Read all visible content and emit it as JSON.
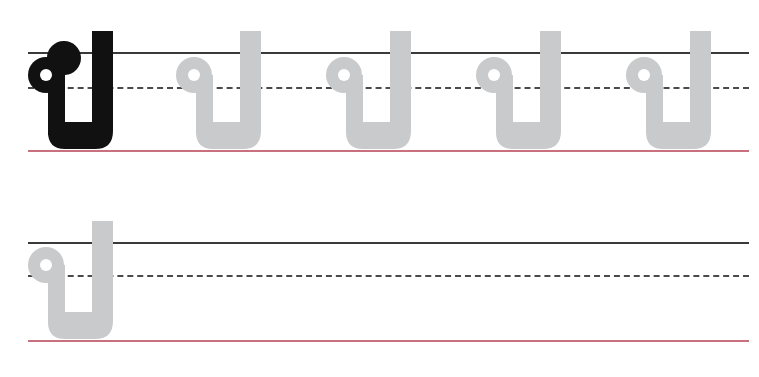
{
  "worksheet": {
    "character": "ป",
    "character_name": "Thai letter po pla",
    "colors": {
      "model_glyph": "#111111",
      "trace_glyph": "#c8cacb",
      "top_line": "#3a3a3a",
      "mid_line": "#4a4a4a",
      "base_line": "#c8707e"
    },
    "rows": [
      {
        "glyphs": [
          {
            "char": "ป",
            "style": "model"
          },
          {
            "char": "ป",
            "style": "trace"
          },
          {
            "char": "ป",
            "style": "trace"
          },
          {
            "char": "ป",
            "style": "trace"
          },
          {
            "char": "ป",
            "style": "trace"
          }
        ]
      },
      {
        "glyphs": [
          {
            "char": "ป",
            "style": "trace"
          }
        ]
      }
    ]
  }
}
